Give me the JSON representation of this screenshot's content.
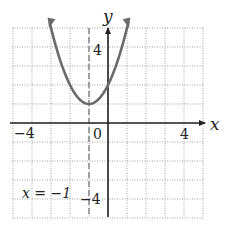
{
  "chart_data": {
    "type": "line",
    "title": "",
    "function": "y = x^2 + 2x + 2",
    "vertex": [
      -1,
      1
    ],
    "axis_of_symmetry": -1,
    "series": [
      {
        "name": "parabola",
        "x": [
          -3.1,
          -3,
          -2.5,
          -2,
          -1.5,
          -1,
          -0.5,
          0,
          0.5,
          1,
          1.1
        ],
        "y": [
          5.41,
          5,
          3.25,
          2,
          1.25,
          1,
          1.25,
          2,
          3.25,
          5,
          5.41
        ],
        "color": "#6b6b6b"
      }
    ],
    "xlabel": "x",
    "ylabel": "y",
    "xlim": [
      -5,
      5
    ],
    "ylim": [
      -5,
      5
    ],
    "grid": true,
    "tick_labels": {
      "x": [
        {
          "value": -4,
          "text": "−4"
        },
        {
          "value": 0,
          "text": "0"
        },
        {
          "value": 4,
          "text": "4"
        }
      ],
      "y": [
        {
          "value": 4,
          "text": "4"
        },
        {
          "value": -4,
          "text": "−4"
        }
      ]
    },
    "annotations": [
      {
        "text": "x = −1",
        "x": -3.5,
        "y": -3.6,
        "note": "dashed vertical line x = -1"
      }
    ]
  },
  "labels": {
    "x_axis": "x",
    "y_axis": "y",
    "tick_x_neg4": "−4",
    "tick_x_0": "0",
    "tick_x_4": "4",
    "tick_y_4": "4",
    "tick_y_neg4": "−4",
    "annotation": "x = −1"
  },
  "colors": {
    "curve": "#6b6b6b",
    "axis": "#222222",
    "grid": "#9a9a9a",
    "dashed_line": "#777777"
  }
}
